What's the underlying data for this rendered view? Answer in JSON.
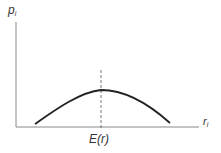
{
  "diagram": {
    "y_axis_label": "p",
    "y_axis_subscript": "i",
    "x_axis_label": "r",
    "x_axis_subscript": "i",
    "peak_marker_label": "E(r)",
    "curve_shape": "concave-down bell (single peak at E(r))",
    "colors": {
      "axis": "#888888",
      "curve": "#222222",
      "dash": "#666666"
    }
  }
}
